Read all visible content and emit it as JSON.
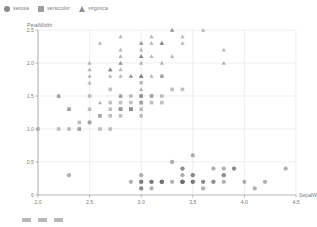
{
  "legend": {
    "position": "top-left",
    "items": [
      {
        "label": "setosa",
        "marker": "circle",
        "icon": "circle-marker-icon",
        "color": "#8a8a8a"
      },
      {
        "label": "versicolor",
        "marker": "square",
        "icon": "square-marker-icon",
        "color": "#9e9e9e"
      },
      {
        "label": "virginica",
        "marker": "triangle",
        "icon": "triangle-marker-icon",
        "color": "#8f8f8f"
      }
    ]
  },
  "bottom_strip": {
    "chip_count": 3,
    "text": ""
  },
  "chart_data": {
    "type": "scatter",
    "title": "",
    "subtitle": "",
    "xlabel": "SepalWidth",
    "ylabel": "PetalWidth",
    "xlim": [
      2.0,
      4.5
    ],
    "ylim": [
      0,
      2.5
    ],
    "xticks": [
      "2.0",
      "2.5",
      "3.0",
      "3.5",
      "4.0",
      "4.5"
    ],
    "xtick_values": [
      2.0,
      2.5,
      3.0,
      3.5,
      4.0,
      4.5
    ],
    "yticks": [
      "0",
      "0.5",
      "1.0",
      "1.5",
      "2.0",
      "2.5"
    ],
    "ytick_values": [
      0,
      0.5,
      1.0,
      1.5,
      2.0,
      2.5
    ],
    "grid": true,
    "grid_color": "#e2e2e2",
    "legend_position": "top-left",
    "marker_opacity": 0.55,
    "marker_size": 3.6,
    "series": [
      {
        "name": "setosa",
        "marker": "circle",
        "color": "#6f6f6f",
        "points": [
          [
            3.5,
            0.2
          ],
          [
            3.0,
            0.2
          ],
          [
            3.2,
            0.2
          ],
          [
            3.1,
            0.2
          ],
          [
            3.6,
            0.2
          ],
          [
            3.9,
            0.4
          ],
          [
            3.4,
            0.3
          ],
          [
            3.4,
            0.2
          ],
          [
            2.9,
            0.2
          ],
          [
            3.1,
            0.1
          ],
          [
            3.7,
            0.2
          ],
          [
            3.4,
            0.2
          ],
          [
            3.0,
            0.1
          ],
          [
            3.0,
            0.1
          ],
          [
            4.0,
            0.2
          ],
          [
            4.4,
            0.4
          ],
          [
            3.9,
            0.4
          ],
          [
            3.5,
            0.3
          ],
          [
            3.8,
            0.3
          ],
          [
            3.8,
            0.3
          ],
          [
            3.4,
            0.2
          ],
          [
            3.7,
            0.4
          ],
          [
            3.6,
            0.2
          ],
          [
            3.3,
            0.5
          ],
          [
            3.4,
            0.2
          ],
          [
            3.0,
            0.2
          ],
          [
            3.4,
            0.4
          ],
          [
            3.5,
            0.2
          ],
          [
            3.4,
            0.2
          ],
          [
            3.2,
            0.2
          ],
          [
            3.1,
            0.2
          ],
          [
            3.4,
            0.4
          ],
          [
            4.1,
            0.1
          ],
          [
            4.2,
            0.2
          ],
          [
            3.1,
            0.2
          ],
          [
            3.2,
            0.2
          ],
          [
            3.5,
            0.2
          ],
          [
            3.6,
            0.1
          ],
          [
            3.0,
            0.2
          ],
          [
            3.4,
            0.2
          ],
          [
            3.5,
            0.3
          ],
          [
            2.3,
            0.3
          ],
          [
            3.2,
            0.2
          ],
          [
            3.5,
            0.6
          ],
          [
            3.8,
            0.4
          ],
          [
            3.0,
            0.3
          ],
          [
            3.8,
            0.2
          ],
          [
            3.2,
            0.2
          ],
          [
            3.7,
            0.2
          ],
          [
            3.3,
            0.2
          ]
        ]
      },
      {
        "name": "versicolor",
        "marker": "square",
        "color": "#8c8c8c",
        "points": [
          [
            3.2,
            1.4
          ],
          [
            3.2,
            1.5
          ],
          [
            3.1,
            1.5
          ],
          [
            2.3,
            1.3
          ],
          [
            2.8,
            1.5
          ],
          [
            2.8,
            1.3
          ],
          [
            3.3,
            1.6
          ],
          [
            2.4,
            1.0
          ],
          [
            2.9,
            1.3
          ],
          [
            2.7,
            1.4
          ],
          [
            2.0,
            1.0
          ],
          [
            3.0,
            1.5
          ],
          [
            2.2,
            1.0
          ],
          [
            2.9,
            1.4
          ],
          [
            2.9,
            1.3
          ],
          [
            3.1,
            1.4
          ],
          [
            3.0,
            1.5
          ],
          [
            2.7,
            1.0
          ],
          [
            2.2,
            1.5
          ],
          [
            2.5,
            1.1
          ],
          [
            3.2,
            1.8
          ],
          [
            2.8,
            1.3
          ],
          [
            2.5,
            1.5
          ],
          [
            2.8,
            1.2
          ],
          [
            2.9,
            1.3
          ],
          [
            3.0,
            1.4
          ],
          [
            2.8,
            1.4
          ],
          [
            3.0,
            1.7
          ],
          [
            2.9,
            1.5
          ],
          [
            2.6,
            1.0
          ],
          [
            2.4,
            1.1
          ],
          [
            2.4,
            1.0
          ],
          [
            2.7,
            1.2
          ],
          [
            2.7,
            1.6
          ],
          [
            3.0,
            1.5
          ],
          [
            3.4,
            1.6
          ],
          [
            3.1,
            1.5
          ],
          [
            2.3,
            1.3
          ],
          [
            3.0,
            1.3
          ],
          [
            2.5,
            1.3
          ],
          [
            2.6,
            1.2
          ],
          [
            3.0,
            1.4
          ],
          [
            2.6,
            1.2
          ],
          [
            2.3,
            1.0
          ],
          [
            2.7,
            1.3
          ],
          [
            3.0,
            1.2
          ],
          [
            2.9,
            1.3
          ],
          [
            2.9,
            1.3
          ],
          [
            2.5,
            1.1
          ],
          [
            2.8,
            1.3
          ]
        ]
      },
      {
        "name": "virginica",
        "marker": "triangle",
        "color": "#7d7d7d",
        "points": [
          [
            3.3,
            2.5
          ],
          [
            2.7,
            1.9
          ],
          [
            3.0,
            2.1
          ],
          [
            2.9,
            1.8
          ],
          [
            3.0,
            2.2
          ],
          [
            3.0,
            2.1
          ],
          [
            2.5,
            1.7
          ],
          [
            2.9,
            1.8
          ],
          [
            2.5,
            1.8
          ],
          [
            3.6,
            2.5
          ],
          [
            3.2,
            2.0
          ],
          [
            2.7,
            1.9
          ],
          [
            3.0,
            2.1
          ],
          [
            2.5,
            2.0
          ],
          [
            2.8,
            2.4
          ],
          [
            3.2,
            2.3
          ],
          [
            3.0,
            1.8
          ],
          [
            3.8,
            2.2
          ],
          [
            2.6,
            2.3
          ],
          [
            2.2,
            1.5
          ],
          [
            3.2,
            2.3
          ],
          [
            2.8,
            2.0
          ],
          [
            2.8,
            2.0
          ],
          [
            2.7,
            1.8
          ],
          [
            3.3,
            2.1
          ],
          [
            3.2,
            1.8
          ],
          [
            2.8,
            1.8
          ],
          [
            3.0,
            1.8
          ],
          [
            2.8,
            2.1
          ],
          [
            3.0,
            1.6
          ],
          [
            2.8,
            1.9
          ],
          [
            3.8,
            2.0
          ],
          [
            2.8,
            2.2
          ],
          [
            2.8,
            1.5
          ],
          [
            2.6,
            1.4
          ],
          [
            3.0,
            2.3
          ],
          [
            3.4,
            2.4
          ],
          [
            3.1,
            1.8
          ],
          [
            3.0,
            1.8
          ],
          [
            3.1,
            2.1
          ],
          [
            3.1,
            2.4
          ],
          [
            3.1,
            2.3
          ],
          [
            2.7,
            1.9
          ],
          [
            3.2,
            2.3
          ],
          [
            3.3,
            2.5
          ],
          [
            3.0,
            2.3
          ],
          [
            2.5,
            1.9
          ],
          [
            3.0,
            2.0
          ],
          [
            3.4,
            2.3
          ],
          [
            3.0,
            1.8
          ]
        ]
      }
    ]
  }
}
